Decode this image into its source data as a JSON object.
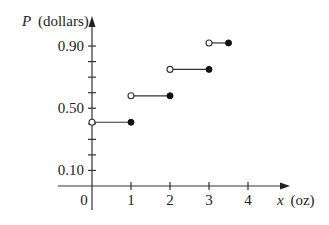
{
  "chart_data": {
    "type": "line",
    "subtype": "step",
    "title": "",
    "xlabel": "x (oz)",
    "ylabel": "P (dollars)",
    "xlabel_var": "x",
    "xlabel_unit": "(oz)",
    "ylabel_var": "P",
    "ylabel_unit": "(dollars)",
    "x_ticks": [
      "0",
      "1",
      "2",
      "3",
      "4"
    ],
    "y_tick_labels": [
      "0.10",
      "0.50",
      "0.90"
    ],
    "y_ticks": [
      0.1,
      0.2,
      0.3,
      0.4,
      0.5,
      0.6,
      0.7,
      0.8,
      0.9
    ],
    "xlim": [
      0,
      5
    ],
    "ylim": [
      0,
      1.0
    ],
    "grid": false,
    "legend": null,
    "segments": [
      {
        "x_start": 0,
        "x_end": 1,
        "y": 0.41,
        "start": "open",
        "end": "closed"
      },
      {
        "x_start": 1,
        "x_end": 2,
        "y": 0.58,
        "start": "open",
        "end": "closed"
      },
      {
        "x_start": 2,
        "x_end": 3,
        "y": 0.75,
        "start": "open",
        "end": "closed"
      },
      {
        "x_start": 3,
        "x_end": 3.5,
        "y": 0.92,
        "start": "open",
        "end": "closed"
      }
    ],
    "colors": {
      "line": "#333333",
      "axis": "#333333",
      "text": "#222222"
    }
  }
}
